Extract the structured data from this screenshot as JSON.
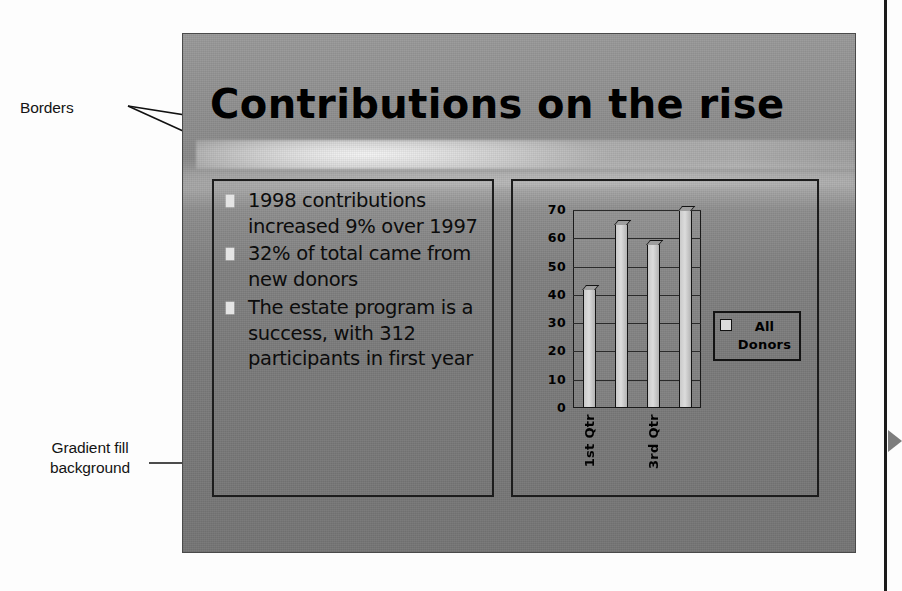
{
  "figure": {
    "annotations": [
      {
        "id": "borders",
        "label": "Borders"
      },
      {
        "id": "gradient",
        "label": "Gradient fill\nbackground"
      }
    ],
    "page_marker": "right-triangle-marker"
  },
  "slide": {
    "title": "Contributions on the rise",
    "background_style": "gradient fill",
    "body": {
      "bullets": [
        "1998 contributions increased 9% over 1997",
        "32% of total came from new donors",
        "The estate program is a success, with 312 participants in first year"
      ],
      "bullet_marker": "square-bullet-icon"
    }
  },
  "chart_data": {
    "type": "bar",
    "title": "",
    "xlabel": "",
    "ylabel": "",
    "categories": [
      "1st Qtr",
      "2nd Qtr",
      "3rd Qtr",
      "4th Qtr"
    ],
    "visible_tick_labels": [
      "1st Qtr",
      "3rd Qtr"
    ],
    "values": [
      42,
      65,
      58,
      70
    ],
    "series": [
      {
        "name": "All Donors",
        "values": [
          42,
          65,
          58,
          70
        ]
      }
    ],
    "ylim": [
      0,
      70
    ],
    "yticks": [
      70,
      60,
      50,
      40,
      30,
      20,
      10,
      0
    ],
    "ytick_labels": [
      "70",
      "60",
      "50",
      "40",
      "30",
      "20",
      "10",
      "0"
    ],
    "grid": true,
    "legend": {
      "position": "right",
      "entries": [
        "All Donors"
      ]
    },
    "legend_label_line1": "All",
    "legend_label_line2": "Donors"
  },
  "colors": {
    "slide_background": "#8d8d8d",
    "border": "#1c1c1c",
    "bar_fill": "#dcdcdc",
    "bullet_marker": "#e4e4e4",
    "text": "#0c0c0c",
    "page_marker": "#7d7d7d"
  }
}
